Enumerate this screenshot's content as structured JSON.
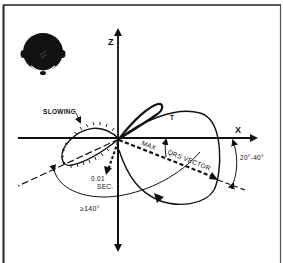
{
  "diagram": {
    "type": "vectorcardiogram-loop",
    "axes": {
      "x_label": "X",
      "z_label": "Z"
    },
    "labels": {
      "slowing": "SLOWING",
      "t_loop": "T",
      "max": "MAX",
      "qrs_vector": "QRS VECTOR",
      "time_line1": "0.01",
      "time_line2": "SEC.",
      "angle_large": "≥140°",
      "angle_small": "20°-40°"
    },
    "icons": {
      "head": "head-top-view-icon"
    },
    "colors": {
      "ink": "#111111",
      "background": "#ffffff"
    }
  }
}
